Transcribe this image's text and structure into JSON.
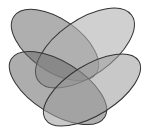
{
  "diagram": {
    "type": "venn",
    "set_count": 4,
    "background": "#ffffff",
    "outline_color": "#333333",
    "sets": [
      {
        "id": "set-top-left",
        "fill": "#7a7a7a",
        "opacity": 0.6,
        "cx": 55,
        "cy": 45,
        "rx": 50,
        "ry": 26,
        "rotate": 35
      },
      {
        "id": "set-top-right",
        "fill": "#b0b0b0",
        "opacity": 0.6,
        "cx": 85,
        "cy": 48,
        "rx": 57,
        "ry": 28,
        "rotate": -35
      },
      {
        "id": "set-bottom-left",
        "fill": "#6a6a6a",
        "opacity": 0.55,
        "cx": 58,
        "cy": 88,
        "rx": 55,
        "ry": 26,
        "rotate": 32
      },
      {
        "id": "set-bottom-right",
        "fill": "#9a9a9a",
        "opacity": 0.55,
        "cx": 92,
        "cy": 90,
        "rx": 55,
        "ry": 25,
        "rotate": -32
      }
    ],
    "labels": []
  }
}
